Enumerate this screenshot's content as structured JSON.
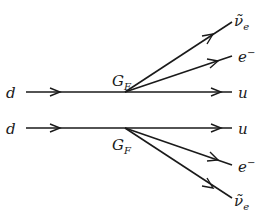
{
  "diagrams": [
    {
      "id": "top",
      "incoming": "d",
      "outgoing_straight": "u",
      "coupling": "G",
      "coupling_sub": "F",
      "branches": [
        {
          "particle": "ν̃",
          "sub": "e"
        },
        {
          "particle": "e",
          "sup": "−"
        }
      ]
    },
    {
      "id": "bottom",
      "incoming": "d",
      "outgoing_straight": "u",
      "coupling": "G",
      "coupling_sub": "F",
      "branches": [
        {
          "particle": "e",
          "sup": "−"
        },
        {
          "particle": "ν̃",
          "sub": "e"
        }
      ]
    }
  ]
}
